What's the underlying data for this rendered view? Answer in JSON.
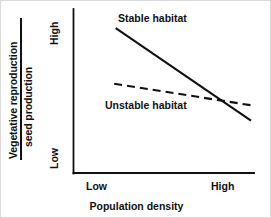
{
  "chart_data": {
    "type": "line",
    "title": "",
    "subtitle": "",
    "xlabel": "Population density",
    "ylabel": "Vegetative reproduction / seed production",
    "ylabel_numerator": "Vegetative reproduction",
    "ylabel_denominator": "seed production",
    "x_tick_labels": [
      "Low",
      "High"
    ],
    "y_tick_labels": [
      "Low",
      "High"
    ],
    "xlim": [
      0,
      1
    ],
    "ylim": [
      0,
      1
    ],
    "grid": false,
    "legend_position": "inline-annotations",
    "axis_color": "#111111",
    "series": [
      {
        "name": "Stable habitat",
        "style": "solid",
        "color": "#111111",
        "x": [
          0.13,
          1.0
        ],
        "values": [
          0.94,
          0.34
        ]
      },
      {
        "name": "Unstable habitat",
        "style": "dashed",
        "color": "#111111",
        "x": [
          0.12,
          1.0
        ],
        "values": [
          0.58,
          0.44
        ]
      }
    ],
    "annotations": [
      {
        "text": "Stable habitat",
        "x": 0.27,
        "y": 0.93
      },
      {
        "text": "Unstable habitat",
        "x": 0.19,
        "y": 0.4
      }
    ]
  }
}
